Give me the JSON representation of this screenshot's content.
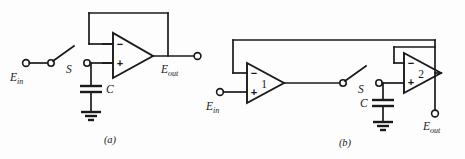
{
  "figure": {
    "background_color": "#fdfdfd",
    "line_color": "#1a1a1a",
    "width": 465,
    "height": 159
  },
  "circuits": [
    {
      "id": "a",
      "caption": "(a)",
      "description": "Sample-and-hold using a single unity-gain follower",
      "input_label": "E",
      "input_subscript": "in",
      "output_label": "E",
      "output_subscript": "out",
      "switch_label": "S",
      "switch_state": "open",
      "capacitor_label": "C",
      "ground": "earth-ground",
      "amplifiers": [
        {
          "number": "",
          "inverting_sign": "−",
          "noninverting_sign": "+",
          "feedback": "output-to-inverting-input"
        }
      ]
    },
    {
      "id": "b",
      "caption": "(b)",
      "description": "Sample-and-hold using two amplifiers with overall feedback",
      "input_label": "E",
      "input_subscript": "in",
      "output_label": "E",
      "output_subscript": "out",
      "switch_label": "S",
      "switch_state": "open",
      "capacitor_label": "C",
      "ground": "earth-ground",
      "amplifiers": [
        {
          "number": "1",
          "inverting_sign": "−",
          "noninverting_sign": "+",
          "feedback": "from-amp2-output"
        },
        {
          "number": "2",
          "inverting_sign": "−",
          "noninverting_sign": "+",
          "feedback": "output-to-inverting-input"
        }
      ]
    }
  ]
}
